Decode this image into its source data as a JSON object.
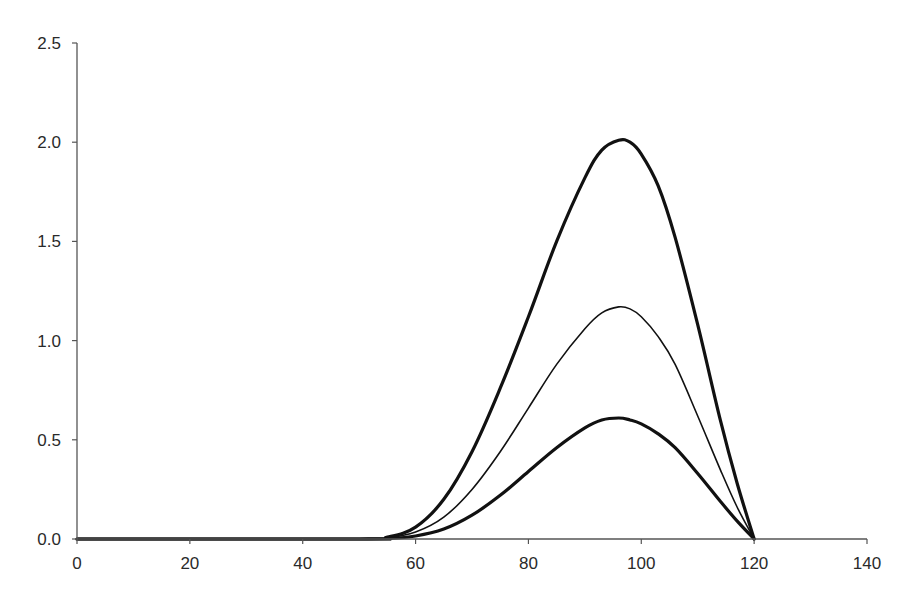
{
  "chart_data": {
    "type": "line",
    "title": "",
    "xlabel": "",
    "ylabel": "",
    "xlim": [
      0,
      140
    ],
    "ylim": [
      0,
      2.5
    ],
    "grid": false,
    "legend": null,
    "x_ticks": [
      "0",
      "20",
      "40",
      "60",
      "80",
      "100",
      "120",
      "140"
    ],
    "y_ticks": [
      "0.0",
      "0.5",
      "1.0",
      "1.5",
      "2.0",
      "2.5"
    ],
    "series": [
      {
        "name": "upper (thick)",
        "stroke_width": 3.2,
        "points": [
          [
            0,
            0
          ],
          [
            50,
            0
          ],
          [
            55,
            0.01
          ],
          [
            60,
            0.06
          ],
          [
            65,
            0.2
          ],
          [
            70,
            0.44
          ],
          [
            75,
            0.76
          ],
          [
            80,
            1.12
          ],
          [
            85,
            1.5
          ],
          [
            90,
            1.82
          ],
          [
            93,
            1.96
          ],
          [
            96,
            2.01
          ],
          [
            98,
            2.0
          ],
          [
            100,
            1.94
          ],
          [
            103,
            1.78
          ],
          [
            106,
            1.52
          ],
          [
            110,
            1.08
          ],
          [
            114,
            0.6
          ],
          [
            117,
            0.28
          ],
          [
            120,
            0
          ]
        ]
      },
      {
        "name": "middle (thin)",
        "stroke_width": 1.6,
        "points": [
          [
            0,
            0
          ],
          [
            50,
            0
          ],
          [
            55,
            0.005
          ],
          [
            60,
            0.035
          ],
          [
            65,
            0.11
          ],
          [
            70,
            0.25
          ],
          [
            75,
            0.44
          ],
          [
            80,
            0.66
          ],
          [
            85,
            0.88
          ],
          [
            90,
            1.06
          ],
          [
            93,
            1.14
          ],
          [
            96,
            1.17
          ],
          [
            98,
            1.16
          ],
          [
            100,
            1.12
          ],
          [
            103,
            1.02
          ],
          [
            106,
            0.88
          ],
          [
            110,
            0.62
          ],
          [
            114,
            0.35
          ],
          [
            117,
            0.16
          ],
          [
            120,
            0
          ]
        ]
      },
      {
        "name": "lower (thick)",
        "stroke_width": 3.2,
        "points": [
          [
            0,
            0
          ],
          [
            50,
            0
          ],
          [
            55,
            0.002
          ],
          [
            60,
            0.015
          ],
          [
            65,
            0.05
          ],
          [
            70,
            0.12
          ],
          [
            75,
            0.22
          ],
          [
            80,
            0.34
          ],
          [
            85,
            0.46
          ],
          [
            90,
            0.56
          ],
          [
            93,
            0.6
          ],
          [
            96,
            0.61
          ],
          [
            98,
            0.6
          ],
          [
            100,
            0.58
          ],
          [
            103,
            0.53
          ],
          [
            106,
            0.46
          ],
          [
            110,
            0.33
          ],
          [
            114,
            0.19
          ],
          [
            117,
            0.09
          ],
          [
            120,
            0
          ]
        ]
      }
    ]
  },
  "colors": {
    "axis": "#555555",
    "line": "#111111",
    "text": "#2a2a2a"
  }
}
